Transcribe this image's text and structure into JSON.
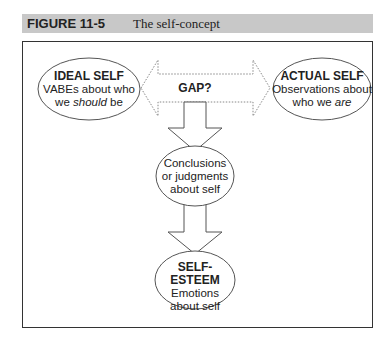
{
  "figure": {
    "number": "FIGURE 11-5",
    "title": "The self-concept"
  },
  "nodes": {
    "ideal": {
      "title": "IDEAL SELF",
      "line1": "VABEs about who",
      "line2_pre": "we ",
      "line2_em": "should",
      "line2_post": " be"
    },
    "actual": {
      "title": "ACTUAL SELF",
      "line1": "Observations about",
      "line2_pre": "who we ",
      "line2_em": "are"
    },
    "gap": {
      "label": "GAP?"
    },
    "conclusions": {
      "line1": "Conclusions",
      "line2": "or judgments",
      "line3": "about self"
    },
    "esteem": {
      "title": "SELF-ESTEEM",
      "line1": "Emotions",
      "line2": "about self"
    }
  }
}
